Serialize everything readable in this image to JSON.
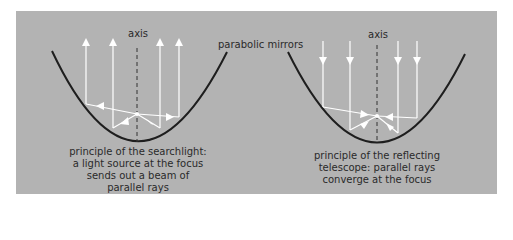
{
  "figure": {
    "shared_label": "parabolic mirrors",
    "left_panel": {
      "axis_label": "axis",
      "caption_lines": [
        "principle of the searchlight:",
        "a light source at the focus",
        "sends out a beam of",
        "parallel rays"
      ],
      "ray_direction": "outward-up"
    },
    "right_panel": {
      "axis_label": "axis",
      "caption_lines": [
        "principle of the reflecting",
        "telescope: parallel rays",
        "converge at the focus"
      ],
      "ray_direction": "inward-down"
    },
    "colors": {
      "background": "#b3b3b3",
      "mirror": "#1e1e1e",
      "rays": "#ffffff",
      "axis": "#333333",
      "text": "#2a2a2a"
    }
  }
}
